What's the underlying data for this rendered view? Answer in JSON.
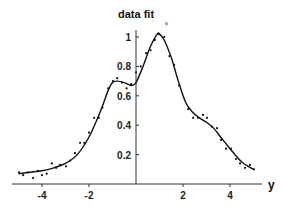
{
  "chart_data": {
    "type": "scatter",
    "title": "data fit",
    "xlabel": "y",
    "ylabel": "",
    "xlim": [
      -5.2,
      5.4
    ],
    "ylim": [
      0,
      1.05
    ],
    "grid": false,
    "legend": null,
    "x_ticks": [
      -4,
      -2,
      2,
      4
    ],
    "x_tick_labels": [
      "-4",
      "-2",
      "2",
      "4"
    ],
    "y_ticks": [
      0.2,
      0.4,
      0.6,
      0.8,
      1
    ],
    "y_tick_labels": [
      "0.2",
      "0.4",
      "0.6",
      "0.8",
      "1"
    ],
    "series": [
      {
        "name": "data",
        "style": "points",
        "x": [
          -4.98,
          -4.8,
          -4.6,
          -4.38,
          -4.17,
          -4.0,
          -3.8,
          -3.58,
          -3.4,
          -3.23,
          -2.98,
          -2.8,
          -2.6,
          -2.38,
          -2.2,
          -2.0,
          -1.78,
          -1.58,
          -1.43,
          -1.18,
          -0.98,
          -0.8,
          -0.6,
          -0.4,
          -0.2,
          0.0,
          0.2,
          0.43,
          0.62,
          0.8,
          0.98,
          1.2,
          1.42,
          1.62,
          1.83,
          2.22,
          2.43,
          2.64,
          2.85,
          3.02,
          3.23,
          3.45,
          3.62,
          3.83,
          4.04,
          4.26,
          4.43,
          4.64,
          4.85,
          5.02
        ],
        "y": [
          0.08,
          0.06,
          0.08,
          0.04,
          0.09,
          0.06,
          0.07,
          0.14,
          0.11,
          0.13,
          0.12,
          0.16,
          0.21,
          0.28,
          0.28,
          0.35,
          0.45,
          0.45,
          0.52,
          0.65,
          0.7,
          0.72,
          0.69,
          0.65,
          0.68,
          0.76,
          0.8,
          0.89,
          0.91,
          0.98,
          1.02,
          1.0,
          0.87,
          0.81,
          0.67,
          0.51,
          0.45,
          0.45,
          0.47,
          0.45,
          0.39,
          0.38,
          0.3,
          0.24,
          0.24,
          0.17,
          0.14,
          0.11,
          0.13,
          0.1
        ]
      },
      {
        "name": "fit",
        "style": "line",
        "x": [
          -5.0,
          -4.5,
          -4.0,
          -3.5,
          -3.0,
          -2.5,
          -2.0,
          -1.5,
          -1.2,
          -1.0,
          -0.8,
          -0.5,
          -0.2,
          0.0,
          0.3,
          0.6,
          0.9,
          1.0,
          1.2,
          1.5,
          1.8,
          2.1,
          2.4,
          2.7,
          3.0,
          3.3,
          3.6,
          4.0,
          4.5,
          5.0
        ],
        "y": [
          0.07,
          0.08,
          0.09,
          0.11,
          0.14,
          0.2,
          0.32,
          0.5,
          0.63,
          0.69,
          0.7,
          0.69,
          0.67,
          0.69,
          0.8,
          0.93,
          1.02,
          1.02,
          0.98,
          0.86,
          0.7,
          0.56,
          0.49,
          0.45,
          0.42,
          0.38,
          0.32,
          0.24,
          0.15,
          0.1
        ]
      }
    ],
    "annotations": [
      {
        "type": "marker",
        "x": 1.3,
        "y": 1.09,
        "color": "#aaaaaa"
      }
    ]
  }
}
